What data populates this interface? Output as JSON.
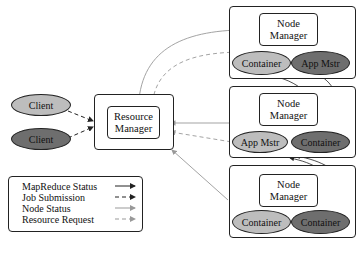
{
  "diagram": {
    "clients": [
      {
        "label": "Client",
        "shade": "light"
      },
      {
        "label": "Client",
        "shade": "dark"
      }
    ],
    "resource_manager": {
      "label_line1": "Resource",
      "label_line2": "Manager"
    },
    "nodes": [
      {
        "manager_line1": "Node",
        "manager_line2": "Manager",
        "slots": [
          {
            "label": "Container",
            "shade": "light"
          },
          {
            "label": "App Mstr",
            "shade": "dark"
          }
        ]
      },
      {
        "manager_line1": "Node",
        "manager_line2": "Manager",
        "slots": [
          {
            "label": "App Mstr",
            "shade": "light"
          },
          {
            "label": "Container",
            "shade": "dark"
          }
        ]
      },
      {
        "manager_line1": "Node",
        "manager_line2": "Manager",
        "slots": [
          {
            "label": "Container",
            "shade": "light"
          },
          {
            "label": "Container",
            "shade": "dark"
          }
        ]
      }
    ],
    "legend": [
      {
        "label": "MapReduce Status",
        "style": "solid-dark"
      },
      {
        "label": "Job Submission",
        "style": "dashed-dark"
      },
      {
        "label": "Node Status",
        "style": "solid-light"
      },
      {
        "label": "Resource Request",
        "style": "dashed-light"
      }
    ],
    "colors": {
      "light_fill": "#bdbdbd",
      "dark_fill": "#6e6e6e",
      "line_dark": "#222222",
      "line_light": "#999999"
    }
  }
}
